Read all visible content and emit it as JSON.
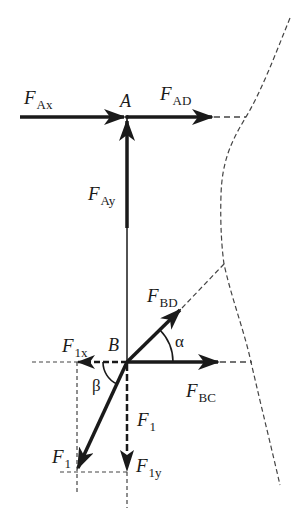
{
  "diagram": {
    "type": "free-body force diagram",
    "points": {
      "A": {
        "label": "A",
        "x": 127,
        "y": 117
      },
      "B": {
        "label": "B",
        "x": 127,
        "y": 362
      }
    },
    "forces": [
      {
        "id": "F_Ax",
        "main": "F",
        "sub": "Ax",
        "label_x": 24,
        "label_y": 88
      },
      {
        "id": "F_AD",
        "main": "F",
        "sub": "AD",
        "label_x": 160,
        "label_y": 84
      },
      {
        "id": "F_Ay",
        "main": "F",
        "sub": "Ay",
        "label_x": 88,
        "label_y": 184
      },
      {
        "id": "F_BD",
        "main": "F",
        "sub": "BD",
        "label_x": 147,
        "label_y": 286
      },
      {
        "id": "F_1x",
        "main": "F",
        "sub": "1x",
        "label_x": 62,
        "label_y": 339
      },
      {
        "id": "F_BC",
        "main": "F",
        "sub": "BC",
        "label_x": 186,
        "label_y": 381
      },
      {
        "id": "F_1_dashed",
        "main": "F",
        "sub": "1",
        "label_x": 137,
        "label_y": 410
      },
      {
        "id": "F_1",
        "main": "F",
        "sub": "1",
        "label_x": 52,
        "label_y": 447
      },
      {
        "id": "F_1y",
        "main": "F",
        "sub": "1y",
        "label_x": 136,
        "label_y": 456
      }
    ],
    "angles": [
      {
        "id": "alpha",
        "symbol": "α",
        "label_x": 175,
        "label_y": 337
      },
      {
        "id": "beta",
        "symbol": "β",
        "label_x": 92,
        "label_y": 377
      }
    ],
    "colors": {
      "stroke": "#1a1a1a",
      "dashed": "#444444",
      "background": "#ffffff"
    }
  }
}
